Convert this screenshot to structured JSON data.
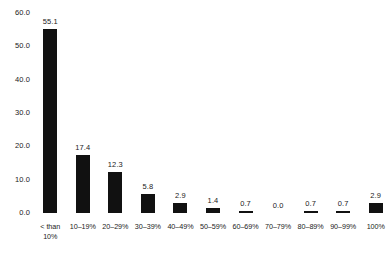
{
  "chart_data": {
    "type": "bar",
    "title": "",
    "subtitle": "",
    "xlabel": "",
    "ylabel": "",
    "ylim": [
      0.0,
      60.0
    ],
    "yticks": [
      "0.0",
      "10.0",
      "20.0",
      "30.0",
      "40.0",
      "50.0",
      "60.0"
    ],
    "ytick_values": [
      0.0,
      10.0,
      20.0,
      30.0,
      40.0,
      50.0,
      60.0
    ],
    "grid": false,
    "legend": false,
    "legend_position": "none",
    "bar_color": "#111111",
    "background_color": "#ffffff",
    "categories": [
      "< than\n10%",
      "10–19%",
      "20–29%",
      "30–39%",
      "40–49%",
      "50–59%",
      "60–69%",
      "70–79%",
      "80–89%",
      "90–99%",
      "100%"
    ],
    "values": [
      55.1,
      17.4,
      12.3,
      5.8,
      2.9,
      1.4,
      0.7,
      0.0,
      0.7,
      0.7,
      2.9
    ],
    "value_labels": [
      "55.1",
      "17.4",
      "12.3",
      "5.8",
      "2.9",
      "1.4",
      "0.7",
      "0.0",
      "0.7",
      "0.7",
      "2.9"
    ]
  }
}
